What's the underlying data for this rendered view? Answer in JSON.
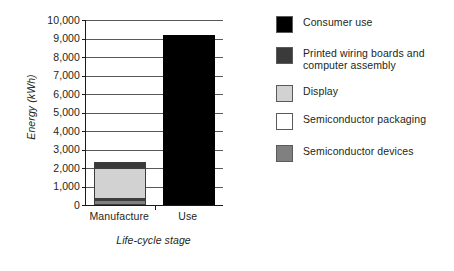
{
  "chart_data": {
    "type": "bar",
    "subtype": "stacked-bar",
    "title": "",
    "xlabel": "Life-cycle stage",
    "ylabel": "Energy (kWh)",
    "categories": [
      "Manufacture",
      "Use"
    ],
    "ylim": [
      0,
      10000
    ],
    "ytick_labels": [
      "0",
      "1,000",
      "2,000",
      "3,000",
      "4,000",
      "5,000",
      "6,000",
      "7,000",
      "8,000",
      "9,000",
      "10,000"
    ],
    "ytick_values": [
      0,
      1000,
      2000,
      3000,
      4000,
      5000,
      6000,
      7000,
      8000,
      9000,
      10000
    ],
    "grid": "horizontal",
    "legend_position": "right",
    "series": [
      {
        "name": "Consumer use",
        "color": "#000000",
        "values": [
          0,
          9200
        ]
      },
      {
        "name": "Printed wiring boards and computer assembly",
        "color": "#3a3a3a",
        "values": [
          300,
          0
        ]
      },
      {
        "name": "Display",
        "color": "#d2d2d2",
        "values": [
          1650,
          0
        ]
      },
      {
        "name": "Semiconductor packaging",
        "color": "#ffffff",
        "values": [
          100,
          0
        ]
      },
      {
        "name": "Semiconductor devices",
        "color": "#808080",
        "values": [
          250,
          0
        ]
      }
    ],
    "totals": [
      2300,
      9200
    ]
  },
  "axes": {
    "y_title": "Energy (kWh)",
    "x_title": "Life-cycle stage",
    "y_ticks": [
      {
        "label": "10,000",
        "value": 10000
      },
      {
        "label": "9,000",
        "value": 9000
      },
      {
        "label": "8,000",
        "value": 8000
      },
      {
        "label": "7,000",
        "value": 7000
      },
      {
        "label": "6,000",
        "value": 6000
      },
      {
        "label": "5,000",
        "value": 5000
      },
      {
        "label": "4,000",
        "value": 4000
      },
      {
        "label": "3,000",
        "value": 3000
      },
      {
        "label": "2,000",
        "value": 2000
      },
      {
        "label": "1,000",
        "value": 1000
      },
      {
        "label": "0",
        "value": 0
      }
    ],
    "x_ticks": [
      {
        "label": "Manufacture"
      },
      {
        "label": "Use"
      }
    ]
  },
  "legend": {
    "items": [
      {
        "label": "Consumer use",
        "color": "#000000"
      },
      {
        "label": "Printed wiring boards and\ncomputer assembly",
        "color": "#3a3a3a"
      },
      {
        "label": "Display",
        "color": "#d2d2d2"
      },
      {
        "label": "Semiconductor packaging",
        "color": "#ffffff"
      },
      {
        "label": "Semiconductor devices",
        "color": "#808080"
      }
    ]
  },
  "colors": {
    "background": "#ffffff",
    "text": "#231f20",
    "axis": "#1a1a1a",
    "gridline": "#58595b",
    "bar_outline": "#3d3d3d"
  }
}
